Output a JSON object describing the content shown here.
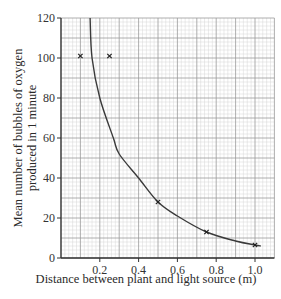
{
  "chart_data": {
    "type": "scatter",
    "title": "",
    "xlabel": "Distance between plant and light source (m)",
    "ylabel_lines": [
      "Mean number of bubbles of oxygen",
      "produced in 1 minute"
    ],
    "xlim": [
      0,
      1.1
    ],
    "ylim": [
      0,
      120
    ],
    "x_ticks": [
      0.2,
      0.4,
      0.6,
      0.8,
      1.0
    ],
    "x_tick_labels": [
      "0.2",
      "0.4",
      "0.6",
      "0.8",
      "1.0"
    ],
    "y_ticks": [
      0,
      20,
      40,
      60,
      80,
      100,
      120
    ],
    "y_tick_labels": [
      "0",
      "20",
      "40",
      "60",
      "80",
      "100",
      "120"
    ],
    "grid": true,
    "legend": null,
    "series": [
      {
        "name": "Measured points",
        "marker": "x",
        "points": [
          {
            "x": 0.1,
            "y": 101
          },
          {
            "x": 0.25,
            "y": 101
          },
          {
            "x": 0.5,
            "y": 28
          },
          {
            "x": 0.75,
            "y": 13
          },
          {
            "x": 1.0,
            "y": 6.5
          }
        ]
      },
      {
        "name": "Curve of best fit",
        "type": "line",
        "points": [
          {
            "x": 0.15,
            "y": 120
          },
          {
            "x": 0.16,
            "y": 100
          },
          {
            "x": 0.2,
            "y": 80
          },
          {
            "x": 0.27,
            "y": 60
          },
          {
            "x": 0.3,
            "y": 52
          },
          {
            "x": 0.4,
            "y": 40
          },
          {
            "x": 0.5,
            "y": 28
          },
          {
            "x": 0.6,
            "y": 21
          },
          {
            "x": 0.75,
            "y": 13
          },
          {
            "x": 0.9,
            "y": 8.5
          },
          {
            "x": 1.0,
            "y": 6.5
          },
          {
            "x": 1.03,
            "y": 6
          }
        ]
      }
    ]
  },
  "colors": {
    "axis": "#333333",
    "grid_major": "#9a9a9a",
    "grid_minor": "#d6d6d6",
    "curve": "#3a3a3a",
    "marker": "#222222"
  }
}
